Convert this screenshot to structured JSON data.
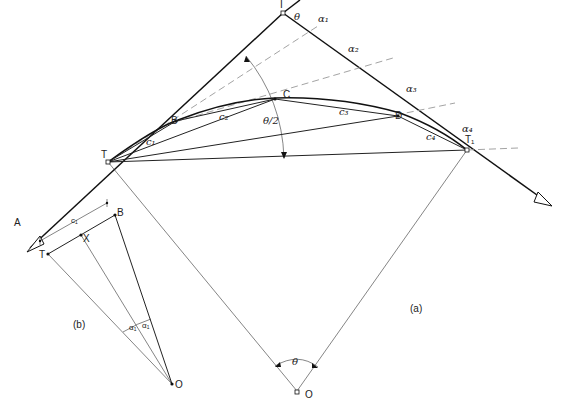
{
  "figure": {
    "panel_a_label": "(a)",
    "panel_b_label": "(b)"
  },
  "points": {
    "I": "I",
    "T": "T",
    "T1": "T₁",
    "A": "A",
    "B": "B",
    "C": "C",
    "D": "D",
    "O": "O",
    "X": "X"
  },
  "chords": {
    "c1": "c₁",
    "c2": "c₂",
    "c3": "c₃",
    "c4": "c₄"
  },
  "angles": {
    "theta": "θ",
    "half_theta": "θ/2",
    "alpha1": "α₁",
    "alpha2": "α₂",
    "alpha3": "α₃",
    "alpha4": "α₄",
    "theta_center": "θ"
  },
  "panel_b": {
    "chord_label": "c₁",
    "point_T": "T",
    "point_X": "X",
    "point_B": "B",
    "point_O": "O",
    "alpha_left": "α₁",
    "alpha_right": "α₁"
  }
}
